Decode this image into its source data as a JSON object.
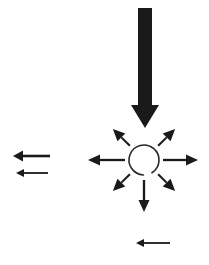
{
  "figure": {
    "width": 209,
    "height": 265,
    "background_color": "#ffffff",
    "ink_color": "#1a1a1a",
    "description": "A single heavy downward arrow impinges on an open circle, from which seven thin arrows radiate outward in all directions; three separate thin left-pointing arrows appear at the left margin and lower area."
  },
  "elements": {
    "incoming_arrow": {
      "name": "thick downward arrow",
      "direction": "down",
      "weight": "heavy",
      "color": "#1a1a1a",
      "shaft_x": 145,
      "shaft_top_y": 8,
      "shaft_width": 14,
      "head_tip_y": 128,
      "head_width": 28,
      "head_length": 23
    },
    "hub": {
      "name": "open circle",
      "shape": "circle-outline-with-gap",
      "center_x": 144,
      "center_y": 160,
      "radius": 15,
      "stroke_width": 1.6,
      "color": "#2a2a2a",
      "gap_degrees": 34,
      "gap_center_degrees": 75
    },
    "radial_arrows": [
      {
        "label": "up-left",
        "angle_deg": 225,
        "inner_r": 20,
        "outer_r": 44,
        "weight": "thin"
      },
      {
        "label": "up-right",
        "angle_deg": 315,
        "inner_r": 20,
        "outer_r": 44,
        "weight": "thin"
      },
      {
        "label": "left",
        "angle_deg": 180,
        "inner_r": 19,
        "outer_r": 56,
        "weight": "thin"
      },
      {
        "label": "right",
        "angle_deg": 0,
        "inner_r": 19,
        "outer_r": 54,
        "weight": "thin"
      },
      {
        "label": "down-left",
        "angle_deg": 135,
        "inner_r": 20,
        "outer_r": 44,
        "weight": "thin"
      },
      {
        "label": "down-right",
        "angle_deg": 45,
        "inner_r": 20,
        "outer_r": 44,
        "weight": "thin"
      },
      {
        "label": "down",
        "angle_deg": 90,
        "inner_r": 20,
        "outer_r": 52,
        "weight": "thin"
      }
    ],
    "side_arrows": [
      {
        "label": "upper left margin arrow",
        "direction": "left",
        "tail_x": 50,
        "tip_x": 13,
        "y": 156,
        "stroke_width": 2.6,
        "head_width": 11,
        "head_length": 10
      },
      {
        "label": "lower left margin arrow",
        "direction": "left",
        "tail_x": 48,
        "tip_x": 16,
        "y": 173,
        "stroke_width": 1.8,
        "head_width": 8,
        "head_length": 8
      },
      {
        "label": "bottom arrow",
        "direction": "left",
        "tail_x": 170,
        "tip_x": 136,
        "y": 243,
        "stroke_width": 1.8,
        "head_width": 8,
        "head_length": 8
      }
    ]
  }
}
